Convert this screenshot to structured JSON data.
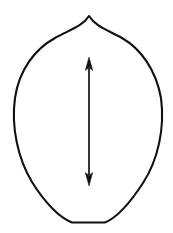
{
  "figure": {
    "kind": "botanical-outline-diagram",
    "canvas": {
      "width": 173,
      "height": 233
    },
    "background_color": "#ffffff",
    "stroke_color": "#111111"
  },
  "shape": {
    "name": "ovate-leaf-outline",
    "description": "Egg-shaped closed outline, pointed apex at top, broadly rounded sides, flattened rounded base",
    "apex": {
      "x": 89,
      "y": 16
    },
    "base_center": {
      "x": 88,
      "y": 223
    },
    "base_flat_span": {
      "x_start": 72,
      "x_end": 105,
      "y": 223
    },
    "widest": {
      "y": 102,
      "x_left": 14.5,
      "x_right": 162
    },
    "stroke_width": 2.1,
    "fill": "none",
    "path": "M 89 16 C 96 27 108 30 122 38 C 141 49 156 70 161 98 C 165 128 158 160 143 183 C 130 203 116 218 105 222.5 L 72 222.5 C 60 218 45 203 32 182 C 18 159 11 127 15 98 C 19 70 35 49 55 38 C 69 30 82 27 89 16 Z"
  },
  "arrow": {
    "name": "length-measurement-arrow",
    "orientation": "vertical",
    "double_headed": true,
    "x": 89,
    "top_tip_y": 57,
    "bottom_tip_y": 186,
    "shaft_top_y": 68,
    "shaft_bottom_y": 175,
    "shaft_width": 1.7,
    "head_half_width": 3.6,
    "head_length": 12,
    "color": "#111111"
  }
}
